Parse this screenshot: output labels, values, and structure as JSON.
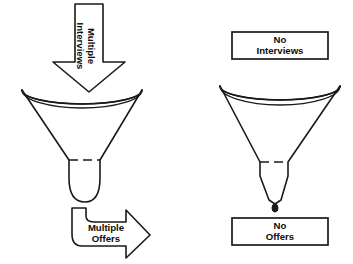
{
  "figure": {
    "background_color": "#ffffff",
    "line_color": "#1a1a1a"
  },
  "left_panel": {
    "name": "successful-funnel",
    "input_arrow": {
      "icon": "down-arrow-icon",
      "line1": "Multiple",
      "line2": "Interviews",
      "direction": "down"
    },
    "funnel": {
      "icon": "funnel-icon",
      "stem": "wide"
    },
    "output_arrow": {
      "icon": "bent-right-arrow-icon",
      "line1": "Multiple",
      "line2": "Offers",
      "direction": "right"
    }
  },
  "right_panel": {
    "name": "unsuccessful-funnel",
    "input_box": {
      "icon": "rectangle-label-icon",
      "line1": "No",
      "line2": "Interviews"
    },
    "funnel": {
      "icon": "funnel-icon",
      "stem": "narrow",
      "drip": "droplet-icon"
    },
    "output_box": {
      "icon": "rectangle-label-icon",
      "line1": "No",
      "line2": "Offers"
    }
  }
}
